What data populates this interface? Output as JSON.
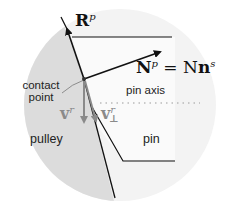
{
  "diagram": {
    "colors": {
      "outer_disc": "#f3f3f3",
      "pulley_region": "#dcdcdc",
      "pin_region": "#ffffff",
      "outline": "#111111",
      "velocity_arrows": "#8a8a8a"
    },
    "labels": {
      "R_main": "R",
      "R_sup": "p",
      "N_main": "N",
      "N_sup": "p",
      "N_eq": "= N",
      "N_n": "n",
      "N_n_sup": "s",
      "vr_main": "v",
      "vr_sup": "r",
      "vperp_main": "v",
      "vperp_sup": "r",
      "vperp_sub": "⊥",
      "contact_line1": "contact",
      "contact_line2": "point",
      "pin_axis": "pin axis",
      "pulley": "pulley",
      "pin": "pin"
    }
  }
}
